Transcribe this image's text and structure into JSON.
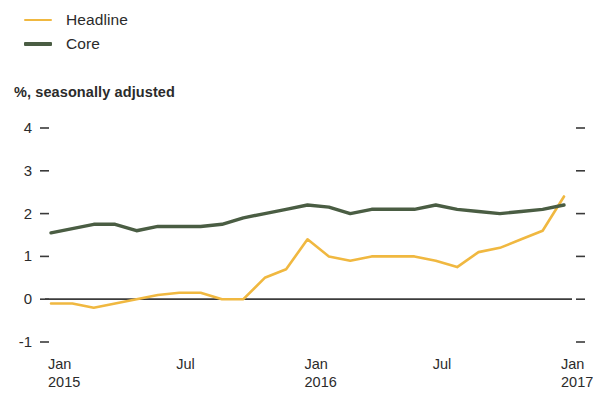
{
  "legend": {
    "items": [
      {
        "label": "Headline",
        "color": "#F0B840",
        "name": "headline"
      },
      {
        "label": "Core",
        "color": "#4A5D43",
        "name": "core"
      }
    ]
  },
  "subtitle": "%, seasonally adjusted",
  "chart_data": {
    "type": "line",
    "title": "",
    "subtitle": "%, seasonally adjusted",
    "xlabel": "",
    "ylabel": "",
    "ylim": [
      -1,
      4
    ],
    "yticks": [
      4,
      3,
      2,
      1,
      0,
      -1
    ],
    "ytick_labels": [
      "4",
      "3",
      "2",
      "1",
      "0",
      "-1"
    ],
    "grid": false,
    "legend_position": "top-left",
    "zero_line": true,
    "right_axis_ticks": true,
    "x": [
      "Jan 2015",
      "Feb 2015",
      "Mar 2015",
      "Apr 2015",
      "May 2015",
      "Jun 2015",
      "Jul 2015",
      "Aug 2015",
      "Sep 2015",
      "Oct 2015",
      "Nov 2015",
      "Dec 2015",
      "Jan 2016",
      "Feb 2016",
      "Mar 2016",
      "Apr 2016",
      "May 2016",
      "Jun 2016",
      "Jul 2016",
      "Aug 2016",
      "Sep 2016",
      "Oct 2016",
      "Nov 2016",
      "Dec 2016",
      "Jan 2017"
    ],
    "xtick_positions": [
      0,
      6,
      12,
      18,
      24
    ],
    "xtick_labels": [
      {
        "month": "Jan",
        "year": "2015"
      },
      {
        "month": "Jul",
        "year": ""
      },
      {
        "month": "Jan",
        "year": "2016"
      },
      {
        "month": "Jul",
        "year": ""
      },
      {
        "month": "Jan",
        "year": "2017"
      }
    ],
    "series": [
      {
        "name": "Headline",
        "color": "#F0B840",
        "values": [
          -0.1,
          -0.1,
          -0.2,
          -0.1,
          0.0,
          0.1,
          0.15,
          0.15,
          0.0,
          0.0,
          0.5,
          0.7,
          1.4,
          1.0,
          0.9,
          1.0,
          1.0,
          1.0,
          0.9,
          0.75,
          1.1,
          1.2,
          1.4,
          1.6,
          2.4
        ]
      },
      {
        "name": "Core",
        "color": "#4A5D43",
        "values": [
          1.55,
          1.65,
          1.75,
          1.75,
          1.6,
          1.7,
          1.7,
          1.7,
          1.75,
          1.9,
          2.0,
          2.1,
          2.2,
          2.15,
          2.0,
          2.1,
          2.1,
          2.1,
          2.2,
          2.1,
          2.05,
          2.0,
          2.05,
          2.1,
          2.2
        ]
      }
    ]
  }
}
